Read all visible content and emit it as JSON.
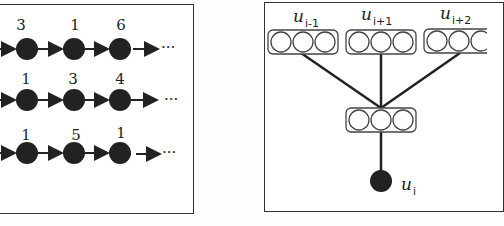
{
  "left_panel": {
    "rows": [
      {
        "values": [
          "3",
          "1",
          "6"
        ],
        "ellipsis": "···"
      },
      {
        "values": [
          "1",
          "3",
          "4"
        ],
        "ellipsis": "···"
      },
      {
        "values": [
          "1",
          "5",
          "1"
        ],
        "ellipsis": "···"
      }
    ]
  },
  "right_panel": {
    "top_vectors": [
      {
        "label": "u",
        "sub": "i-1"
      },
      {
        "label": "u",
        "sub": "i+1"
      },
      {
        "label": "u",
        "sub": "i+2"
      }
    ],
    "output": {
      "label": "u",
      "sub": "i"
    }
  }
}
